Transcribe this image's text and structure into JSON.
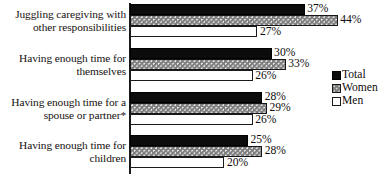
{
  "chart_data": {
    "type": "bar",
    "orientation": "horizontal",
    "title": "",
    "subtitle": "",
    "xlabel": "",
    "ylabel": "",
    "xlim": [
      0,
      48
    ],
    "grid": false,
    "legend_position": "right-middle",
    "value_suffix": "%",
    "categories": [
      "Juggling caregiving with other responsibilities",
      "Having enough time for themselves",
      "Having enough time for a spouse or partner*",
      "Having enough time for children"
    ],
    "category_lines": [
      [
        "Juggling caregiving with",
        "other responsibilities"
      ],
      [
        "Having enough time for",
        "themselves"
      ],
      [
        "Having enough time for a",
        "spouse or partner*"
      ],
      [
        "Having enough time for",
        "children"
      ]
    ],
    "series": [
      {
        "name": "Total",
        "key": "total",
        "color": "#0c0c0c",
        "values": [
          37,
          30,
          28,
          25
        ],
        "labels": [
          "37%",
          "30%",
          "28%",
          "25%"
        ]
      },
      {
        "name": "Women",
        "key": "women",
        "color": "#7e7e7e",
        "values": [
          44,
          33,
          29,
          28
        ],
        "labels": [
          "44%",
          "33%",
          "29%",
          "28%"
        ]
      },
      {
        "name": "Men",
        "key": "men",
        "color": "#ffffff",
        "values": [
          27,
          26,
          26,
          20
        ],
        "labels": [
          "27%",
          "26%",
          "26%",
          "20%"
        ]
      }
    ]
  },
  "legend": {
    "items": [
      {
        "label": "Total",
        "key": "total"
      },
      {
        "label": "Women",
        "key": "women"
      },
      {
        "label": "Men",
        "key": "men"
      }
    ]
  }
}
